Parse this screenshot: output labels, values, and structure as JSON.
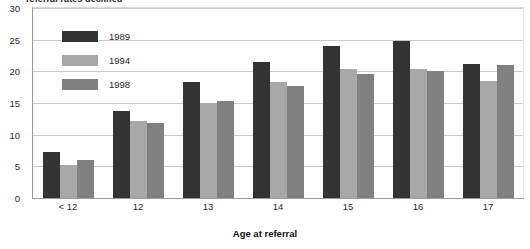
{
  "title": "referral rates declined",
  "chart_data": {
    "type": "bar",
    "title": "referral rates declined",
    "xlabel": "Age at referral",
    "ylabel": "",
    "categories": [
      "< 12",
      "12",
      "13",
      "14",
      "15",
      "16",
      "17"
    ],
    "series": [
      {
        "name": "1989",
        "color": "#333333",
        "values": [
          7.2,
          13.7,
          18.3,
          21.5,
          24.0,
          24.8,
          21.2
        ]
      },
      {
        "name": "1994",
        "color": "#a8a8a8",
        "values": [
          5.2,
          12.1,
          15.0,
          18.3,
          20.4,
          20.4,
          18.4
        ]
      },
      {
        "name": "1998",
        "color": "#808080",
        "values": [
          6.0,
          11.8,
          15.3,
          17.7,
          19.6,
          20.1,
          21.0
        ]
      }
    ],
    "ylim": [
      0,
      30
    ],
    "yticks": [
      0,
      5,
      10,
      15,
      20,
      25,
      30
    ],
    "grid": true,
    "legend_position": "inside-top-left"
  },
  "axes": {
    "y_tick_labels": [
      "30",
      "25",
      "20",
      "15",
      "10",
      "5",
      "0"
    ],
    "x_tick_labels": [
      "< 12",
      "12",
      "13",
      "14",
      "15",
      "16",
      "17"
    ],
    "x_axis_title": "Age at referral"
  },
  "legend": {
    "items": [
      {
        "label": "1989",
        "color": "#333333"
      },
      {
        "label": "1994",
        "color": "#a8a8a8"
      },
      {
        "label": "1998",
        "color": "#808080"
      }
    ]
  },
  "colors": {
    "series_1989": "#333333",
    "series_1994": "#a8a8a8",
    "series_1998": "#808080",
    "gridline": "#c9c9c9",
    "plot_background": "#ffffff"
  }
}
